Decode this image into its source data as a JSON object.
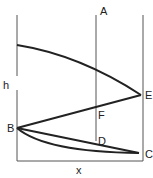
{
  "diagram": {
    "labels": {
      "A": "A",
      "B": "B",
      "C": "C",
      "D": "D",
      "E": "E",
      "F": "F",
      "h": "h",
      "x": "x"
    },
    "stroke_color": "#222222"
  }
}
